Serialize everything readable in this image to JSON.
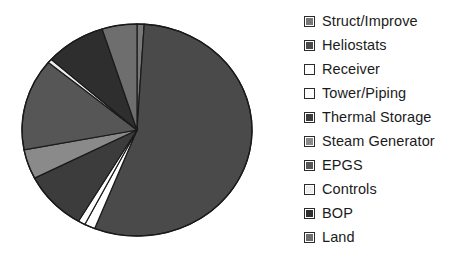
{
  "chart_data": {
    "type": "pie",
    "title": "",
    "legend_position": "right",
    "grid": false,
    "categories": [
      "Struct/Improve",
      "Heliostats",
      "Receiver",
      "Tower/Piping",
      "Thermal Storage",
      "Steam Generator",
      "EPGS",
      "Controls",
      "BOP",
      "Land"
    ],
    "values": [
      1.0,
      55.0,
      1.5,
      1.0,
      9.0,
      4.5,
      14.0,
      0.6,
      8.5,
      4.9
    ],
    "unit": "percent",
    "colors": [
      "#787878",
      "#4a4a4a",
      "#ffffff",
      "#ffffff",
      "#3c3c3c",
      "#8a8a8a",
      "#565656",
      "#eeeeee",
      "#2e2e2e",
      "#6e6e6e"
    ],
    "slices": [
      {
        "label": "Struct/Improve",
        "value": 1.0,
        "color": "#787878"
      },
      {
        "label": "Heliostats",
        "value": 55.0,
        "color": "#4a4a4a"
      },
      {
        "label": "Receiver",
        "value": 1.5,
        "color": "#ffffff"
      },
      {
        "label": "Tower/Piping",
        "value": 1.0,
        "color": "#ffffff"
      },
      {
        "label": "Thermal Storage",
        "value": 9.0,
        "color": "#3c3c3c"
      },
      {
        "label": "Steam Generator",
        "value": 4.5,
        "color": "#8a8a8a"
      },
      {
        "label": "EPGS",
        "value": 14.0,
        "color": "#565656"
      },
      {
        "label": "Controls",
        "value": 0.6,
        "color": "#eeeeee"
      },
      {
        "label": "BOP",
        "value": 8.5,
        "color": "#2e2e2e"
      },
      {
        "label": "Land",
        "value": 4.9,
        "color": "#6e6e6e"
      }
    ],
    "xlabel": "",
    "ylabel": ""
  },
  "legend": {
    "items": [
      {
        "label": "Struct/Improve",
        "swatch": "#787878"
      },
      {
        "label": "Heliostats",
        "swatch": "#4a4a4a"
      },
      {
        "label": "Receiver",
        "swatch": "#ffffff"
      },
      {
        "label": "Tower/Piping",
        "swatch": "#ffffff"
      },
      {
        "label": "Thermal Storage",
        "swatch": "#3c3c3c"
      },
      {
        "label": "Steam Generator",
        "swatch": "#8a8a8a"
      },
      {
        "label": "EPGS",
        "swatch": "#565656"
      },
      {
        "label": "Controls",
        "swatch": "#eeeeee"
      },
      {
        "label": "BOP",
        "swatch": "#2e2e2e"
      },
      {
        "label": "Land",
        "swatch": "#6e6e6e"
      }
    ]
  },
  "pie_geometry": {
    "cx": 137,
    "cy": 130,
    "rx": 115,
    "ry": 106,
    "start_angle_deg": -90,
    "direction": "clockwise",
    "outline_color": "#1a1a1a"
  }
}
